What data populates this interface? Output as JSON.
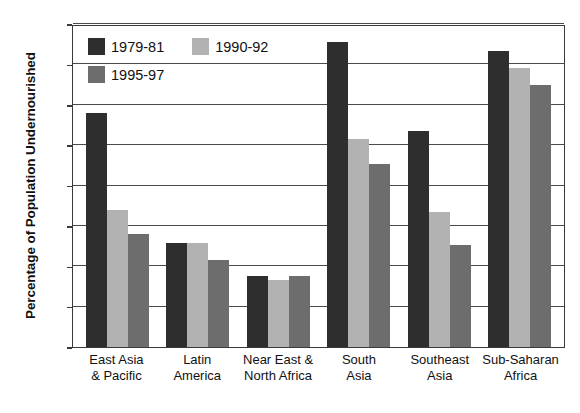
{
  "chart_data": {
    "type": "bar",
    "title": "",
    "xlabel": "",
    "ylabel": "Percentage of Population Undernourished",
    "ylim": [
      0,
      40
    ],
    "yticks": [
      0,
      5,
      10,
      15,
      20,
      25,
      30,
      35,
      40
    ],
    "ytick_labels": [
      "0",
      "5",
      "10",
      "15",
      "20",
      "25",
      "30",
      "35",
      "40"
    ],
    "grid": true,
    "legend_position": "upper-left-inside",
    "categories": [
      "East Asia & Pacific",
      "Latin America",
      "Near East & North Africa",
      "South Asia",
      "Southeast Asia",
      "Sub-Saharan Africa"
    ],
    "category_lines": [
      [
        "East Asia",
        "& Pacific"
      ],
      [
        "Latin",
        "America"
      ],
      [
        "Near East &",
        "North Africa"
      ],
      [
        "South",
        "Asia"
      ],
      [
        "Southeast",
        "Asia"
      ],
      [
        "Sub-Saharan",
        "Africa"
      ]
    ],
    "series": [
      {
        "name": "1979-81",
        "color": "#2e2e2e",
        "values": [
          29.0,
          12.9,
          8.8,
          37.8,
          26.7,
          36.6
        ]
      },
      {
        "name": "1990-92",
        "color": "#b2b2b2",
        "values": [
          17.0,
          12.9,
          8.3,
          25.7,
          16.7,
          34.5
        ]
      },
      {
        "name": "1995-97",
        "color": "#6d6d6d",
        "values": [
          14.0,
          10.8,
          8.8,
          22.7,
          12.6,
          32.5
        ]
      }
    ]
  }
}
